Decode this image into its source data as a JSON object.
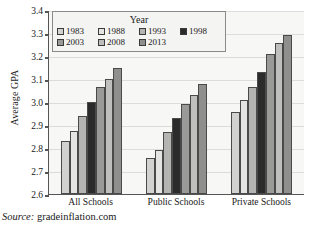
{
  "axis": {
    "ylabel": "Average GPA",
    "yticks": [
      "3.4",
      "3.3",
      "3.2",
      "3.1",
      "3.0",
      "2.9",
      "2.8",
      "2.7",
      "2.6"
    ]
  },
  "legend": {
    "title": "Year",
    "row1": [
      {
        "label": "1983",
        "color": "#d2d2d0"
      },
      {
        "label": "1988",
        "color": "#e4e4e2"
      },
      {
        "label": "1993",
        "color": "#b4b4b2"
      },
      {
        "label": "1998",
        "color": "#2b2b2b"
      }
    ],
    "row2": [
      {
        "label": "2003",
        "color": "#9a9a98"
      },
      {
        "label": "2008",
        "color": "#bfbfbd"
      },
      {
        "label": "2013",
        "color": "#8f8f8d"
      }
    ]
  },
  "caption": {
    "source_label": "Source:",
    "source_value": " gradeinflation.com"
  },
  "chart_data": {
    "type": "bar",
    "title": "",
    "xlabel": "",
    "ylabel": "Average GPA",
    "ylim": [
      2.6,
      3.4
    ],
    "ytick_step": 0.1,
    "grid": true,
    "legend_position": "top-inside",
    "legend_title": "Year",
    "categories": [
      "All Schools",
      "Public Schools",
      "Private Schools"
    ],
    "series": [
      {
        "name": "1983",
        "color": "#d2d2d0",
        "values": [
          2.83,
          2.755,
          2.955
        ]
      },
      {
        "name": "1988",
        "color": "#e4e4e2",
        "values": [
          2.875,
          2.79,
          3.01
        ]
      },
      {
        "name": "1993",
        "color": "#b4b4b2",
        "values": [
          2.94,
          2.87,
          3.065
        ]
      },
      {
        "name": "1998",
        "color": "#2b2b2b",
        "values": [
          3.0,
          2.93,
          3.13
        ]
      },
      {
        "name": "2003",
        "color": "#9a9a98",
        "values": [
          3.065,
          2.99,
          3.21
        ]
      },
      {
        "name": "2008",
        "color": "#bfbfbd",
        "values": [
          3.1,
          3.03,
          3.255
        ]
      },
      {
        "name": "2013",
        "color": "#8f8f8d",
        "values": [
          3.15,
          3.08,
          3.29
        ]
      }
    ]
  }
}
